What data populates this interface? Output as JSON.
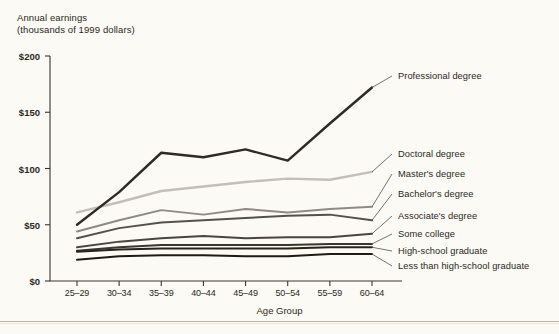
{
  "chart_data": {
    "type": "line",
    "title": "",
    "ylabel": "Annual earnings\n(thousands of 1999 dollars)",
    "xlabel": "Age Group",
    "categories": [
      "25–29",
      "30–34",
      "35–39",
      "40–44",
      "45–49",
      "50–54",
      "55–59",
      "60–64"
    ],
    "ylim": [
      0,
      200
    ],
    "yticks": [
      "$0",
      "$50",
      "$100",
      "$150",
      "$200"
    ],
    "ytick_values": [
      0,
      50,
      100,
      150,
      200
    ],
    "grid": false,
    "legend_position": "right-inline-labels",
    "series": [
      {
        "name": "Professional degree",
        "color": "#2e2a24",
        "width": 2.4,
        "values": [
          50,
          79,
          114,
          110,
          117,
          107,
          140,
          172
        ]
      },
      {
        "name": "Doctoral degree",
        "color": "#c2bfb8",
        "width": 2.4,
        "values": [
          61,
          70,
          80,
          84,
          88,
          91,
          90,
          97
        ]
      },
      {
        "name": "Master's degree",
        "color": "#8d8b84",
        "width": 2.0,
        "values": [
          44,
          54,
          63,
          59,
          64,
          61,
          64,
          66
        ]
      },
      {
        "name": "Bachelor's degree",
        "color": "#55514a",
        "width": 2.0,
        "values": [
          38,
          47,
          52,
          54,
          56,
          58,
          59,
          54
        ]
      },
      {
        "name": "Associate's degree",
        "color": "#4a463f",
        "width": 2.0,
        "values": [
          30,
          35,
          38,
          40,
          38,
          39,
          39,
          42
        ]
      },
      {
        "name": "Some college",
        "color": "#3a362f",
        "width": 2.0,
        "values": [
          27,
          30,
          32,
          32,
          32,
          32,
          33,
          33
        ]
      },
      {
        "name": "High-school graduate",
        "color": "#262319",
        "width": 2.0,
        "values": [
          26,
          28,
          29,
          29,
          29,
          29,
          30,
          30
        ]
      },
      {
        "name": "Less than high-school graduate",
        "color": "#1e1b14",
        "width": 2.0,
        "values": [
          19,
          22,
          23,
          23,
          22,
          22,
          24,
          24
        ]
      }
    ],
    "legend_labels": [
      {
        "label": "Professional degree",
        "y": 76
      },
      {
        "label": "Doctoral degree",
        "y": 154
      },
      {
        "label": "Master's degree",
        "y": 174
      },
      {
        "label": "Bachelor's degree",
        "y": 194
      },
      {
        "label": "Associate's degree",
        "y": 216
      },
      {
        "label": "Some college",
        "y": 234
      },
      {
        "label": "High-school graduate",
        "y": 251
      },
      {
        "label": "Less than high-school graduate",
        "y": 266
      }
    ]
  },
  "colors": {
    "background": "#fbfaf5",
    "axis": "#3a362f",
    "text": "#2b2822"
  }
}
